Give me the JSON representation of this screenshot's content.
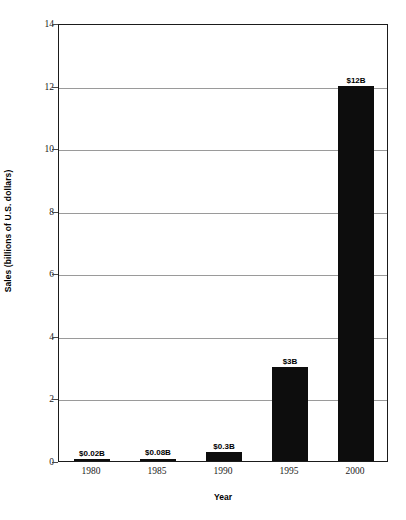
{
  "chart_data": {
    "type": "bar",
    "title": "",
    "xlabel": "Year",
    "ylabel": "Sales (billions of U.S. dollars)",
    "categories": [
      "1980",
      "1985",
      "1990",
      "1995",
      "2000"
    ],
    "values": [
      0.02,
      0.08,
      0.3,
      3,
      12
    ],
    "data_labels": [
      "$0.02B",
      "$0.08B",
      "$0.3B",
      "$3B",
      "$12B"
    ],
    "ylim": [
      0,
      14
    ],
    "yticks": [
      0,
      2,
      4,
      6,
      8,
      10,
      12,
      14
    ],
    "ytick_labels": [
      "0",
      "2",
      "4",
      "6",
      "8",
      "10",
      "12",
      "14"
    ],
    "grid": "horizontal",
    "legend": "none",
    "bar_color": "#0d0d0d",
    "gridline_color": "#9a9a9a",
    "axis_color": "#1b1b1b",
    "background_color": "#ffffff"
  }
}
